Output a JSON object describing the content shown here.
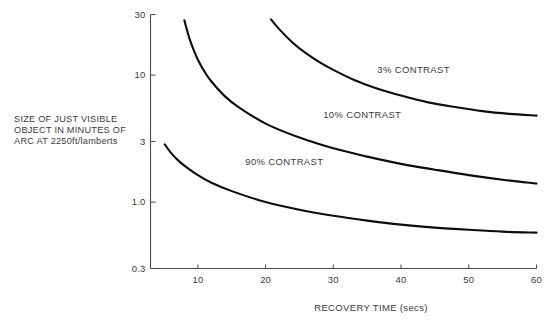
{
  "chart_data": {
    "type": "line",
    "title": "",
    "xlabel": "RECOVERY TIME (secs)",
    "ylabel": "SIZE OF JUST VISIBLE OBJECT IN MINUTES OF ARC AT 2250ft/lamberts",
    "ylabel_lines": [
      "SIZE OF JUST VISIBLE",
      "OBJECT IN MINUTES OF",
      "ARC AT 2250ft/lamberts"
    ],
    "xscale": "linear",
    "yscale": "log",
    "xlim": [
      3,
      60
    ],
    "ylim": [
      0.3,
      30
    ],
    "grid": false,
    "legend_position": "inline-annotations",
    "xticks": [
      10,
      20,
      30,
      40,
      50,
      60
    ],
    "xticklabels": [
      "10",
      "20",
      "30",
      "40",
      "50",
      "60"
    ],
    "yticks": [
      0.3,
      1.0,
      3,
      10,
      30
    ],
    "yticklabels": [
      "0.3",
      "1.0",
      "3",
      "10",
      "30"
    ],
    "line_color": "#0d0d0d",
    "axis_color": "#4a4a4a",
    "background_color": "#ffffff",
    "series": [
      {
        "name": "90% CONTRAST",
        "label": "90% CONTRAST",
        "label_x": 17,
        "label_y": 1.95,
        "x": [
          5.1,
          6,
          7,
          8,
          10,
          12,
          15,
          20,
          25,
          30,
          35,
          40,
          45,
          50,
          55,
          60
        ],
        "y": [
          2.85,
          2.45,
          2.15,
          1.94,
          1.63,
          1.42,
          1.22,
          1.0,
          0.87,
          0.78,
          0.715,
          0.665,
          0.63,
          0.605,
          0.585,
          0.575
        ]
      },
      {
        "name": "10% CONTRAST",
        "label": "10% CONTRAST",
        "label_x": 28.5,
        "label_y": 4.6,
        "x": [
          8.0,
          8.5,
          9,
          10,
          11,
          12,
          14,
          16,
          20,
          25,
          30,
          35,
          40,
          45,
          50,
          55,
          60
        ],
        "y": [
          27.0,
          21.5,
          17.8,
          13.2,
          10.6,
          8.9,
          6.8,
          5.6,
          4.15,
          3.22,
          2.65,
          2.28,
          2.0,
          1.8,
          1.63,
          1.5,
          1.4
        ]
      },
      {
        "name": "3% CONTRAST",
        "label": "3% CONTRAST",
        "label_x": 36.5,
        "label_y": 10.3,
        "x": [
          20.8,
          22,
          24,
          26,
          28,
          30,
          33,
          36,
          40,
          44,
          48,
          52,
          56,
          60
        ],
        "y": [
          27.5,
          23.0,
          18.0,
          14.8,
          12.6,
          11.0,
          9.2,
          8.0,
          6.9,
          6.1,
          5.6,
          5.2,
          4.95,
          4.8
        ]
      }
    ]
  }
}
